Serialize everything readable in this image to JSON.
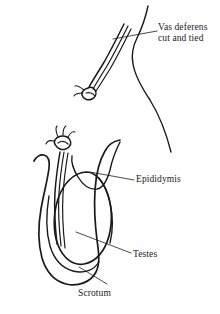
{
  "figure": {
    "background_color": "#ffffff",
    "ink_color": "#1a1a1a",
    "width": 220,
    "height": 314
  },
  "labels": {
    "vas_deferens": {
      "line1": "Vas deferens",
      "line2": "cut and tied"
    },
    "epididymis": "Epididymis",
    "testes": "Testes",
    "scrotum": "Scrotum"
  },
  "parts": [
    {
      "name": "vas-deferens-cut-end",
      "description": "double-line tube with ligature knot, upper detail"
    },
    {
      "name": "body-contour",
      "description": "torso outline curve, upper right"
    },
    {
      "name": "vas-deferens-lower",
      "description": "double-line tube with ligature knot, lower diagram"
    },
    {
      "name": "epididymis",
      "description": "curved duct arc over the testis"
    },
    {
      "name": "testes",
      "description": "inner oval"
    },
    {
      "name": "scrotum",
      "description": "outer enclosing loop"
    }
  ]
}
